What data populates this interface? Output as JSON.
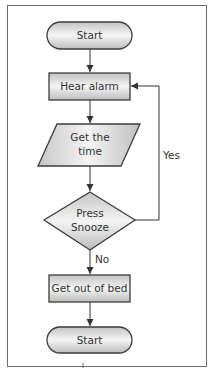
{
  "flowchart": {
    "nodes": [
      {
        "id": "start_top",
        "shape": "terminator",
        "label": "Start"
      },
      {
        "id": "hear_alarm",
        "shape": "process",
        "label": "Hear alarm"
      },
      {
        "id": "get_time",
        "shape": "data",
        "label": "Get the time"
      },
      {
        "id": "press_snooze",
        "shape": "decision",
        "label": "Press Snooze"
      },
      {
        "id": "get_out_of_bed",
        "shape": "process",
        "label": "Get out of bed"
      },
      {
        "id": "start_bottom",
        "shape": "terminator",
        "label": "Start"
      }
    ],
    "edges": [
      {
        "from": "start_top",
        "to": "hear_alarm",
        "label": ""
      },
      {
        "from": "hear_alarm",
        "to": "get_time",
        "label": ""
      },
      {
        "from": "get_time",
        "to": "press_snooze",
        "label": ""
      },
      {
        "from": "press_snooze",
        "to": "hear_alarm",
        "label": "Yes"
      },
      {
        "from": "press_snooze",
        "to": "get_out_of_bed",
        "label": "No"
      },
      {
        "from": "get_out_of_bed",
        "to": "start_bottom",
        "label": ""
      }
    ]
  },
  "labels": {
    "start_top": "Start",
    "hear_alarm": "Hear alarm",
    "get_time_line1": "Get the",
    "get_time_line2": "time",
    "press_snooze_line1": "Press",
    "press_snooze_line2": "Snooze",
    "get_out_of_bed": "Get out of bed",
    "start_bottom": "Start",
    "yes": "Yes",
    "no": "No"
  },
  "colors": {
    "stroke": "#4a4a4a",
    "fill_edge": "#bdbdbd",
    "fill_center": "#f2f2f2",
    "frame": "#6b6b6b"
  }
}
